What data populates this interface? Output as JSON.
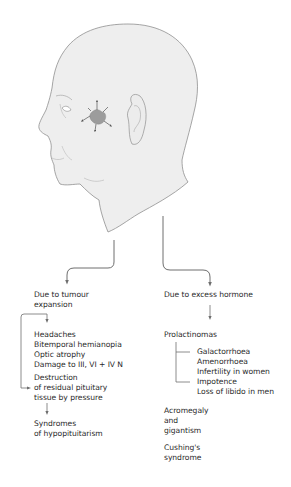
{
  "figure": {
    "illustration": "head-profile-with-pituitary-tumour",
    "colors": {
      "skin": "#eeeeee",
      "outline": "#8a8a8a",
      "tumour": "#9c9c9c",
      "arrow": "#6e6e6e",
      "text": "#2a2a2a"
    }
  },
  "left_branch": {
    "heading": [
      "Due to tumour",
      "expansion"
    ],
    "effects": [
      "Headaches",
      "Bitemporal hemianopia",
      "Optic atrophy",
      "Damage to III, VI + IV N"
    ],
    "destruction": [
      "Destruction",
      "of residual pituitary",
      "tissue by pressure"
    ],
    "outcome": [
      "Syndromes",
      "of hypopituitarism"
    ]
  },
  "right_branch": {
    "heading": "Due to excess hormone",
    "prolactinomas": {
      "label": "Prolactinomas",
      "women": [
        "Galactorrhoea",
        "Amenorrhoea",
        "Infertility in women"
      ],
      "men": [
        "Impotence",
        "Loss of libido in men"
      ]
    },
    "acromegaly": [
      "Acromegaly",
      "and",
      "gigantism"
    ],
    "cushings": [
      "Cushing's",
      "syndrome"
    ]
  }
}
